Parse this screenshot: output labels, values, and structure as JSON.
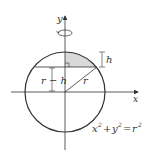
{
  "diagram": {
    "axes": {
      "x_label": "x",
      "y_label": "y"
    },
    "labels": {
      "h": "h",
      "r_minus_h": "r − h",
      "r": "r",
      "equation_lhs_x": "x",
      "equation_plus": "+",
      "equation_y": "y",
      "equation_eq": "=",
      "equation_r": "r",
      "sup2": "2"
    },
    "colors": {
      "stroke": "#333333",
      "shade": "#d9d9d9"
    }
  }
}
